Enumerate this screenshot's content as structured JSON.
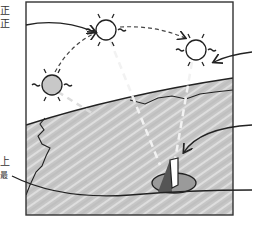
{
  "diagram": {
    "type": "sun-path-sundial-illustration",
    "left_labels": [
      "正",
      "正",
      "上",
      "最"
    ],
    "elements": [
      {
        "name": "sun-noon",
        "shade": "white"
      },
      {
        "name": "sun-afternoon",
        "shade": "white"
      },
      {
        "name": "sun-low",
        "shade": "gray"
      },
      {
        "name": "ground",
        "pattern": "hatched-gray"
      },
      {
        "name": "gnomon",
        "desc": "sundial pole with shadow disk"
      }
    ],
    "colors": {
      "stroke": "#222222",
      "ground": "#c9c9c9",
      "sun_low_fill": "#c8c8c8",
      "sky": "#ffffff"
    }
  }
}
